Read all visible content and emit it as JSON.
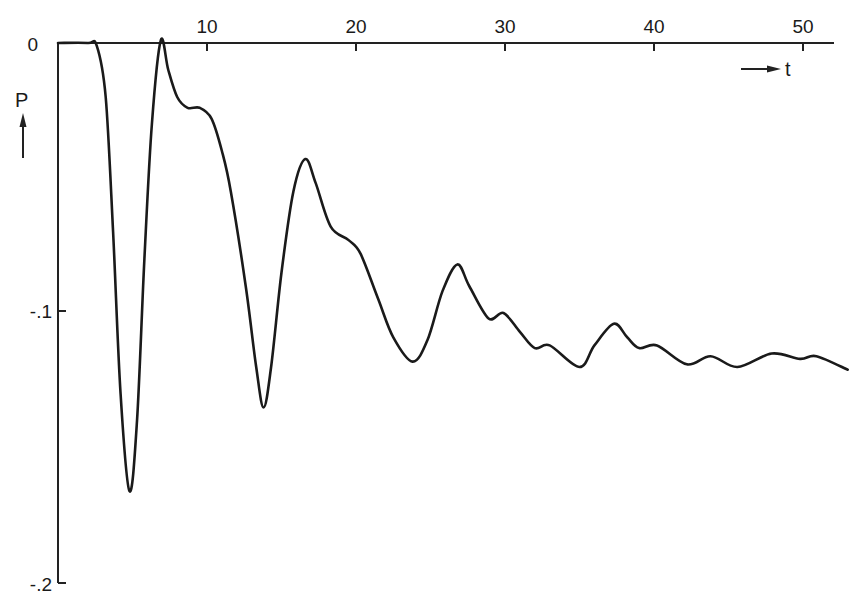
{
  "chart_data": {
    "type": "line",
    "title": "",
    "xlabel": "t",
    "ylabel": "P",
    "xlim": [
      0,
      52.2
    ],
    "ylim": [
      -0.2,
      0
    ],
    "grid": false,
    "legend": null,
    "x_axis_position": "top",
    "x_ticks": [
      10,
      20,
      30,
      40,
      50
    ],
    "x_tick_labels": [
      "10",
      "20",
      "30",
      "40",
      "50"
    ],
    "y_ticks": [
      0,
      -0.1,
      -0.2
    ],
    "y_tick_labels": [
      "0",
      "-.1",
      "-.2"
    ],
    "series": [
      {
        "name": "P(t)",
        "color": "#1a1a1a",
        "x": [
          0,
          2,
          2.6,
          3.2,
          3.7,
          4.2,
          4.8,
          5.3,
          5.8,
          6.3,
          6.9,
          7.4,
          8.0,
          8.7,
          9.5,
          10.3,
          11.0,
          11.6,
          12.6,
          13.3,
          13.8,
          14.3,
          15.0,
          15.8,
          16.6,
          17.3,
          18.3,
          19.5,
          20.3,
          21.5,
          22.5,
          23.8,
          24.8,
          25.8,
          26.8,
          27.6,
          28.9,
          29.9,
          31.0,
          32.0,
          33.0,
          35.0,
          36.0,
          37.3,
          38.2,
          39.0,
          40.2,
          42.2,
          43.8,
          45.6,
          47.9,
          49.8,
          50.9,
          53.0
        ],
        "y": [
          0,
          0,
          -0.001,
          -0.02,
          -0.07,
          -0.13,
          -0.166,
          -0.14,
          -0.08,
          -0.03,
          0.001,
          -0.01,
          -0.02,
          -0.024,
          -0.024,
          -0.028,
          -0.04,
          -0.055,
          -0.09,
          -0.12,
          -0.135,
          -0.12,
          -0.085,
          -0.055,
          -0.043,
          -0.052,
          -0.068,
          -0.073,
          -0.078,
          -0.095,
          -0.109,
          -0.118,
          -0.11,
          -0.092,
          -0.082,
          -0.09,
          -0.102,
          -0.1,
          -0.107,
          -0.113,
          -0.112,
          -0.12,
          -0.112,
          -0.104,
          -0.109,
          -0.113,
          -0.112,
          -0.119,
          -0.116,
          -0.12,
          -0.115,
          -0.117,
          -0.116,
          -0.121
        ]
      }
    ],
    "annotations": [
      {
        "text": "P",
        "role": "y-axis label with upward arrow"
      },
      {
        "text": "t",
        "role": "x-axis label with rightward arrow"
      }
    ]
  },
  "labels": {
    "x_axis": "t",
    "y_axis": "P",
    "x_ticks": [
      "10",
      "20",
      "30",
      "40",
      "50"
    ],
    "y_zero": "0",
    "y_minus_01": "-.1",
    "y_minus_02": "-.2"
  }
}
